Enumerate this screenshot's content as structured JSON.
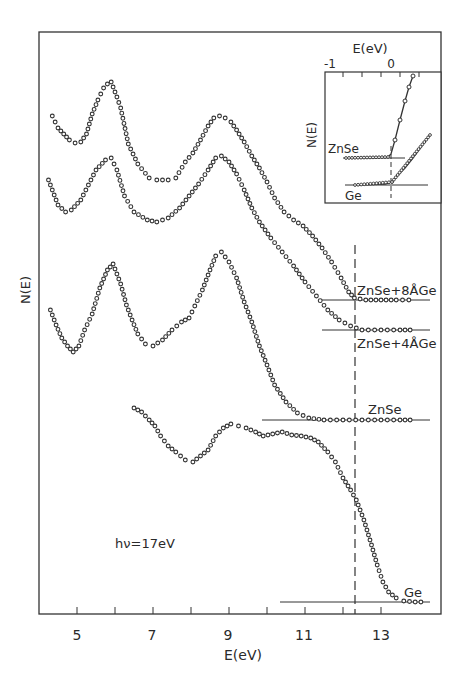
{
  "chart_data": {
    "type": "scatter",
    "title": "",
    "xlabel": "E(eV)",
    "ylabel": "N(E)",
    "xlim": [
      4.1,
      14.7
    ],
    "xticks_major": [
      5,
      7,
      9,
      11,
      13
    ],
    "xticks_minor": [
      6,
      8,
      10,
      12
    ],
    "annotation": "hν=17eV",
    "vline_E": 12.3,
    "series": [
      {
        "name": "ZnSe+8ÅGe",
        "baseline_px": 300,
        "points": [
          [
            4.35,
            116
          ],
          [
            4.5,
            128
          ],
          [
            4.65,
            134
          ],
          [
            4.8,
            140
          ],
          [
            4.95,
            143
          ],
          [
            5.1,
            142
          ],
          [
            5.25,
            134
          ],
          [
            5.4,
            114
          ],
          [
            5.55,
            100
          ],
          [
            5.7,
            88
          ],
          [
            5.8,
            84
          ],
          [
            5.9,
            82
          ],
          [
            6.05,
            97
          ],
          [
            6.15,
            108
          ],
          [
            6.35,
            144
          ],
          [
            6.6,
            164
          ],
          [
            6.9,
            178
          ],
          [
            7.1,
            180
          ],
          [
            7.4,
            180
          ],
          [
            7.6,
            178
          ],
          [
            7.85,
            162
          ],
          [
            8.05,
            153
          ],
          [
            8.25,
            140
          ],
          [
            8.45,
            126
          ],
          [
            8.6,
            118
          ],
          [
            8.75,
            116
          ],
          [
            8.9,
            118
          ],
          [
            9.05,
            122
          ],
          [
            9.2,
            130
          ],
          [
            9.4,
            142
          ],
          [
            9.6,
            156
          ],
          [
            9.8,
            168
          ],
          [
            10.0,
            182
          ],
          [
            10.2,
            198
          ],
          [
            10.45,
            212
          ],
          [
            10.7,
            220
          ],
          [
            10.95,
            226
          ],
          [
            11.2,
            236
          ],
          [
            11.45,
            248
          ],
          [
            11.7,
            262
          ],
          [
            11.95,
            278
          ],
          [
            12.15,
            292
          ],
          [
            12.3,
            298
          ],
          [
            12.6,
            300
          ],
          [
            13.0,
            300
          ],
          [
            13.4,
            300
          ],
          [
            13.9,
            300
          ]
        ]
      },
      {
        "name": "ZnSe+4ÅGe",
        "baseline_px": 330,
        "points": [
          [
            4.25,
            180
          ],
          [
            4.5,
            205
          ],
          [
            4.7,
            212
          ],
          [
            4.85,
            210
          ],
          [
            5.1,
            200
          ],
          [
            5.3,
            185
          ],
          [
            5.5,
            170
          ],
          [
            5.75,
            160
          ],
          [
            5.9,
            158
          ],
          [
            6.05,
            170
          ],
          [
            6.25,
            196
          ],
          [
            6.5,
            212
          ],
          [
            6.85,
            220
          ],
          [
            7.1,
            222
          ],
          [
            7.4,
            218
          ],
          [
            7.7,
            208
          ],
          [
            7.95,
            196
          ],
          [
            8.2,
            184
          ],
          [
            8.45,
            170
          ],
          [
            8.65,
            158
          ],
          [
            8.8,
            156
          ],
          [
            9.0,
            162
          ],
          [
            9.2,
            174
          ],
          [
            9.4,
            190
          ],
          [
            9.6,
            208
          ],
          [
            9.8,
            222
          ],
          [
            10.1,
            238
          ],
          [
            10.4,
            252
          ],
          [
            10.7,
            266
          ],
          [
            11.0,
            282
          ],
          [
            11.3,
            296
          ],
          [
            11.6,
            310
          ],
          [
            11.9,
            320
          ],
          [
            12.2,
            326
          ],
          [
            12.5,
            330
          ],
          [
            13.0,
            330
          ],
          [
            13.5,
            330
          ],
          [
            13.9,
            330
          ]
        ]
      },
      {
        "name": "ZnSe",
        "baseline_px": 420,
        "points": [
          [
            4.3,
            310
          ],
          [
            4.45,
            325
          ],
          [
            4.6,
            338
          ],
          [
            4.75,
            346
          ],
          [
            4.9,
            352
          ],
          [
            5.05,
            346
          ],
          [
            5.2,
            330
          ],
          [
            5.4,
            314
          ],
          [
            5.6,
            288
          ],
          [
            5.8,
            270
          ],
          [
            5.95,
            264
          ],
          [
            6.15,
            284
          ],
          [
            6.3,
            305
          ],
          [
            6.45,
            320
          ],
          [
            6.6,
            334
          ],
          [
            6.8,
            344
          ],
          [
            7.0,
            346
          ],
          [
            7.25,
            340
          ],
          [
            7.5,
            330
          ],
          [
            7.75,
            322
          ],
          [
            7.95,
            318
          ],
          [
            8.1,
            306
          ],
          [
            8.3,
            290
          ],
          [
            8.5,
            270
          ],
          [
            8.65,
            256
          ],
          [
            8.8,
            252
          ],
          [
            9.0,
            262
          ],
          [
            9.2,
            278
          ],
          [
            9.4,
            302
          ],
          [
            9.6,
            322
          ],
          [
            9.8,
            346
          ],
          [
            10.0,
            365
          ],
          [
            10.2,
            385
          ],
          [
            10.5,
            402
          ],
          [
            10.8,
            413
          ],
          [
            11.1,
            418
          ],
          [
            11.5,
            420
          ],
          [
            12.0,
            420
          ],
          [
            12.5,
            420
          ],
          [
            13.0,
            420
          ],
          [
            13.5,
            420
          ],
          [
            13.9,
            420
          ]
        ]
      },
      {
        "name": "Ge",
        "baseline_px": 602,
        "points": [
          [
            6.5,
            408
          ],
          [
            6.7,
            412
          ],
          [
            6.9,
            420
          ],
          [
            7.05,
            426
          ],
          [
            7.2,
            436
          ],
          [
            7.4,
            446
          ],
          [
            7.6,
            452
          ],
          [
            7.85,
            460
          ],
          [
            8.05,
            462
          ],
          [
            8.25,
            456
          ],
          [
            8.45,
            450
          ],
          [
            8.65,
            436
          ],
          [
            8.85,
            428
          ],
          [
            9.05,
            424
          ],
          [
            9.25,
            426
          ],
          [
            9.45,
            428
          ],
          [
            9.7,
            432
          ],
          [
            9.9,
            436
          ],
          [
            10.15,
            434
          ],
          [
            10.4,
            432
          ],
          [
            10.65,
            435
          ],
          [
            10.9,
            436
          ],
          [
            11.15,
            438
          ],
          [
            11.35,
            442
          ],
          [
            11.6,
            452
          ],
          [
            11.8,
            462
          ],
          [
            12.0,
            478
          ],
          [
            12.2,
            490
          ],
          [
            12.35,
            500
          ],
          [
            12.55,
            520
          ],
          [
            12.75,
            545
          ],
          [
            12.9,
            565
          ],
          [
            13.05,
            582
          ],
          [
            13.2,
            592
          ],
          [
            13.4,
            598
          ],
          [
            13.6,
            601
          ],
          [
            13.9,
            602
          ],
          [
            14.2,
            602
          ]
        ]
      }
    ],
    "inset": {
      "xlabel": "E(eV)",
      "ylabel": "N(E)",
      "xtick_labels": [
        "-1",
        "0"
      ],
      "xlim": [
        -1.4,
        1.0
      ],
      "series": [
        {
          "name": "ZnSe",
          "label": "ZnSe"
        },
        {
          "name": "Ge",
          "label": "Ge"
        }
      ]
    }
  },
  "labels": {
    "series_zn8": "ZnSe+8ÅGe",
    "series_zn4": "ZnSe+4ÅGe",
    "series_znse": "ZnSe",
    "series_ge": "Ge",
    "hv": "hν=17eV",
    "xlabel": "E(eV)",
    "ylabel": "N(E)",
    "xt5": "5",
    "xt7": "7",
    "xt9": "9",
    "xt11": "11",
    "xt13": "13",
    "inset_xlabel": "E(eV)",
    "inset_ylabel": "N(E)",
    "inset_xtm1": "-1",
    "inset_xt0": "0",
    "inset_znse": "ZnSe",
    "inset_ge": "Ge"
  }
}
